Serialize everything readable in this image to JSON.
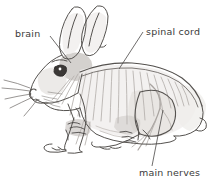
{
  "figure": {
    "background_color": "#ffffff",
    "ink_color": "#55524f",
    "label_color": "#3a3a3a",
    "shade_color": "#cfcbc7",
    "nerve_color": "#b9b4b0"
  },
  "labels": [
    {
      "id": "brain",
      "text": "brain",
      "text_x": 15,
      "text_y": 37,
      "leader": {
        "x1": 50,
        "y1": 36,
        "x2": 71,
        "y2": 63
      }
    },
    {
      "id": "spinal-cord",
      "text": "spinal cord",
      "text_x": 146,
      "text_y": 35,
      "leader": {
        "x1": 143,
        "y1": 32,
        "x2": 119,
        "y2": 69
      }
    },
    {
      "id": "main-nerves",
      "text": "main nerves",
      "text_x": 139,
      "text_y": 176,
      "leader": {
        "x1": 152,
        "y1": 166,
        "x2": 163,
        "y2": 110
      }
    }
  ]
}
